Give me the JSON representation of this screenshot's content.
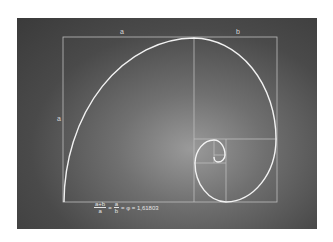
{
  "diagram": {
    "labels": {
      "top_left_segment": "a",
      "top_right_segment": "b",
      "left_side": "a"
    },
    "formula": {
      "fraction1_numerator": "a+b",
      "fraction1_denominator": "a",
      "equals1": "=",
      "fraction2_numerator": "a",
      "fraction2_denominator": "b",
      "result": "= φ = 1,61803"
    },
    "colors": {
      "background_center": "#9a9a9a",
      "background_edge": "#3a3a3a",
      "spiral": "#f2f2f2",
      "grid_lines": "#bdbdbd"
    }
  }
}
